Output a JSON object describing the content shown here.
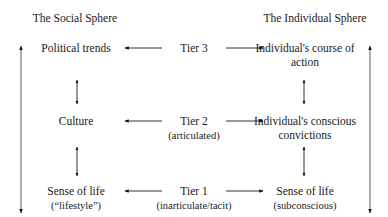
{
  "diagram": {
    "headers": {
      "left": "The Social Sphere",
      "right": "The Individual Sphere"
    },
    "rows": [
      {
        "social": [
          "Political trends"
        ],
        "tier": "Tier 3",
        "tier_note": "",
        "individual": [
          "Individual's course of",
          "action"
        ]
      },
      {
        "social": [
          "Culture"
        ],
        "tier": "Tier 2",
        "tier_note": "(articulated)",
        "individual": [
          "Individual's conscious",
          "convictions"
        ]
      },
      {
        "social": [
          "Sense of life",
          "(“lifestyle”)"
        ],
        "tier": "Tier 1",
        "tier_note": "(inarticulate/tacit)",
        "individual": [
          "Sense of life",
          "(subconscious)"
        ]
      }
    ],
    "colors": {
      "text": "#1a1a1a",
      "arrow": "#111111",
      "long_arrow_line": "#777777"
    }
  }
}
